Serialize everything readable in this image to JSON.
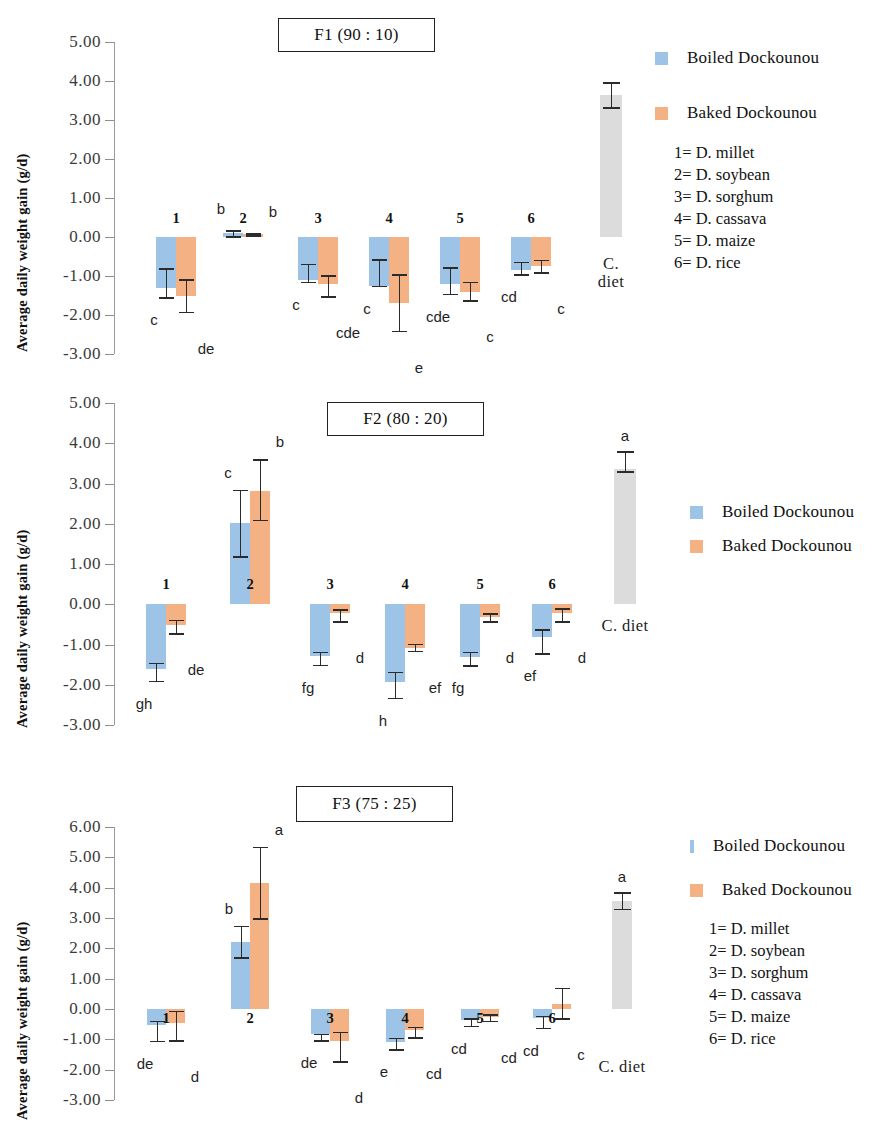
{
  "figure": {
    "y_axis_title": "Average daily weight gain (g/d)",
    "legend": {
      "boiled_label": "Boiled Dockounou",
      "baked_label": "Baked Dockounou",
      "boiled_color": "#9dc3e6",
      "baked_color": "#f4b183",
      "control_color": "#dcdcdc"
    },
    "key_lines": [
      "1= D. millet",
      "2= D. soybean",
      "3= D. sorghum",
      "4= D. cassava",
      "5= D. maize",
      "6= D. rice"
    ],
    "control_label_line1": "C.",
    "control_label_line2": "diet",
    "control_label_inline": "C. diet"
  },
  "chart_data": [
    {
      "type": "bar",
      "title": "F1 (90 : 10)",
      "xlabel": "",
      "ylabel": "Average daily weight gain (g/d)",
      "ylim": [
        -3.0,
        5.0
      ],
      "ytick_labels": [
        "5.00",
        "4.00",
        "3.00",
        "2.00",
        "1.00",
        "0.00",
        "-1.00",
        "-2.00",
        "-3.00"
      ],
      "yticks": [
        5.0,
        4.0,
        3.0,
        2.0,
        1.0,
        0.0,
        -1.0,
        -2.0,
        -3.0
      ],
      "grid": false,
      "legend_position": "right",
      "categories": [
        "1",
        "2",
        "3",
        "4",
        "5",
        "6",
        "C. diet"
      ],
      "series": [
        {
          "name": "Boiled Dockounou",
          "values": [
            -1.3,
            0.1,
            -1.1,
            -1.25,
            -1.2,
            -0.85,
            null
          ],
          "err_low": [
            -1.55,
            0.02,
            -1.15,
            -1.25,
            -1.45,
            -0.95,
            null
          ],
          "err_high": [
            -0.8,
            0.18,
            -0.68,
            -0.57,
            -0.78,
            -0.63,
            null
          ],
          "letters": [
            "c",
            "b",
            "c",
            "c",
            "cde",
            "cd",
            null
          ]
        },
        {
          "name": "Baked Dockounou",
          "values": [
            -1.5,
            0.08,
            -1.2,
            -1.7,
            -1.4,
            -0.75,
            null
          ],
          "err_low": [
            -1.92,
            0.05,
            -1.52,
            -2.4,
            -1.62,
            -0.9,
            null
          ],
          "err_high": [
            -1.08,
            0.1,
            -0.98,
            -0.95,
            -1.15,
            -0.58,
            null
          ],
          "letters": [
            "de",
            "b",
            "cde",
            "e",
            "c",
            "c",
            null
          ]
        },
        {
          "name": "Control diet",
          "values": [
            null,
            null,
            null,
            null,
            null,
            null,
            3.65
          ],
          "err_low": [
            null,
            null,
            null,
            null,
            null,
            null,
            3.33
          ],
          "err_high": [
            null,
            null,
            null,
            null,
            null,
            null,
            3.97
          ],
          "letters": [
            null,
            null,
            null,
            null,
            null,
            null,
            null
          ]
        }
      ]
    },
    {
      "type": "bar",
      "title": "F2 (80 : 20)",
      "xlabel": "",
      "ylabel": "Average daily weight gain (g/d)",
      "ylim": [
        -3.0,
        5.0
      ],
      "ytick_labels": [
        "5.00",
        "4.00",
        "3.00",
        "2.00",
        "1.00",
        "0.00",
        "-1.00",
        "-2.00",
        "-3.00"
      ],
      "yticks": [
        5.0,
        4.0,
        3.0,
        2.0,
        1.0,
        0.0,
        -1.0,
        -2.0,
        -3.0
      ],
      "grid": false,
      "legend_position": "right",
      "categories": [
        "1",
        "2",
        "3",
        "4",
        "5",
        "6",
        "C. diet"
      ],
      "series": [
        {
          "name": "Boiled Dockounou",
          "values": [
            -1.62,
            2.02,
            -1.28,
            -1.92,
            -1.32,
            -0.82,
            null
          ],
          "err_low": [
            -1.9,
            1.2,
            -1.5,
            -2.32,
            -1.52,
            -1.22,
            null
          ],
          "err_high": [
            -1.45,
            2.85,
            -1.18,
            -1.68,
            -1.18,
            -0.62,
            null
          ],
          "letters": [
            "gh",
            "c",
            "fg",
            "h",
            "fg",
            "ef",
            null
          ]
        },
        {
          "name": "Baked Dockounou",
          "values": [
            -0.52,
            2.82,
            -0.22,
            -1.08,
            -0.32,
            -0.22,
            null
          ],
          "err_low": [
            -0.72,
            2.1,
            -0.42,
            -1.15,
            -0.42,
            -0.42,
            null
          ],
          "err_high": [
            -0.38,
            3.6,
            -0.12,
            -0.98,
            -0.22,
            -0.1,
            null
          ],
          "letters": [
            "de",
            "b",
            "d",
            "ef",
            "d",
            "d",
            null
          ]
        },
        {
          "name": "Control diet",
          "values": [
            null,
            null,
            null,
            null,
            null,
            null,
            3.35
          ],
          "err_low": [
            null,
            null,
            null,
            null,
            null,
            null,
            3.3
          ],
          "err_high": [
            null,
            null,
            null,
            null,
            null,
            null,
            3.8
          ],
          "letters": [
            null,
            null,
            null,
            null,
            null,
            null,
            "a"
          ]
        }
      ]
    },
    {
      "type": "bar",
      "title": "F3 (75 : 25)",
      "xlabel": "",
      "ylabel": "Average daily weight gain (g/d)",
      "ylim": [
        -3.0,
        6.0
      ],
      "ytick_labels": [
        "6.00",
        "5.00",
        "4.00",
        "3.00",
        "2.00",
        "1.00",
        "0.00",
        "-1.00",
        "-2.00",
        "-3.00"
      ],
      "yticks": [
        6.0,
        5.0,
        4.0,
        3.0,
        2.0,
        1.0,
        0.0,
        -1.0,
        -2.0,
        -3.0
      ],
      "grid": false,
      "legend_position": "right",
      "categories": [
        "1",
        "2",
        "3",
        "4",
        "5",
        "6",
        "C. diet"
      ],
      "series": [
        {
          "name": "Boiled Dockounou",
          "values": [
            -0.52,
            2.2,
            -0.82,
            -1.1,
            -0.35,
            -0.3,
            null
          ],
          "err_low": [
            -1.05,
            1.7,
            -1.02,
            -1.32,
            -0.55,
            -0.62,
            null
          ],
          "err_high": [
            -0.38,
            2.75,
            -0.82,
            -0.95,
            -0.3,
            -0.22,
            null
          ],
          "letters": [
            "de",
            "b",
            "de",
            "e",
            "cd",
            "cd",
            null
          ]
        },
        {
          "name": "Baked Dockounou",
          "values": [
            -0.45,
            4.15,
            -1.05,
            -0.68,
            -0.28,
            0.18,
            null
          ],
          "err_low": [
            -1.02,
            3.0,
            -1.72,
            -0.92,
            -0.38,
            -0.3,
            null
          ],
          "err_high": [
            -0.05,
            5.35,
            -0.75,
            -0.58,
            -0.18,
            0.7,
            null
          ],
          "letters": [
            "d",
            "a",
            "d",
            "cd",
            "cd",
            "c",
            null
          ]
        },
        {
          "name": "Control diet",
          "values": [
            null,
            null,
            null,
            null,
            null,
            null,
            3.55
          ],
          "err_low": [
            null,
            null,
            null,
            null,
            null,
            null,
            3.3
          ],
          "err_high": [
            null,
            null,
            null,
            null,
            null,
            null,
            3.85
          ],
          "letters": [
            null,
            null,
            null,
            null,
            null,
            null,
            "a"
          ]
        }
      ]
    }
  ]
}
